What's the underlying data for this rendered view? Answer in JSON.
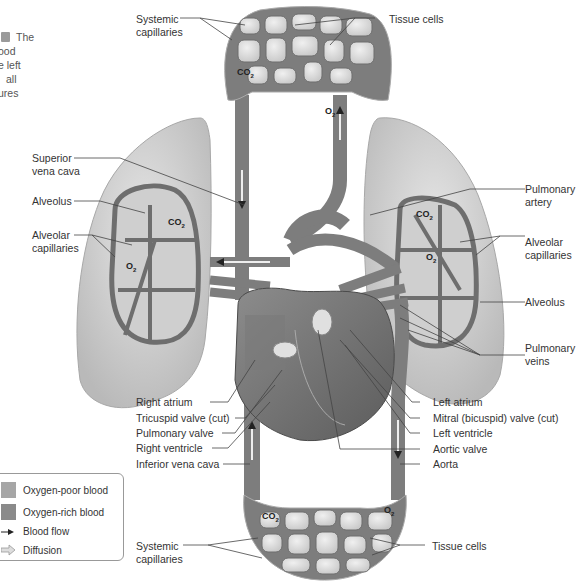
{
  "caption": {
    "badge": "figure-badge",
    "lines": [
      "The",
      "ood",
      "e left",
      "all",
      "ures"
    ]
  },
  "labels": {
    "systemic_capillaries_top": [
      "Systemic",
      "capillaries"
    ],
    "tissue_cells_top": "Tissue cells",
    "superior_vena_cava": [
      "Superior",
      "vena cava"
    ],
    "alveolus_left": "Alveolus",
    "alveolar_capillaries_left": [
      "Alveolar",
      "capillaries"
    ],
    "pulmonary_artery": [
      "Pulmonary",
      "artery"
    ],
    "alveolar_capillaries_right": [
      "Alveolar",
      "capillaries"
    ],
    "alveolus_right": "Alveolus",
    "pulmonary_veins": [
      "Pulmonary",
      "veins"
    ],
    "right_atrium": "Right atrium",
    "tricuspid_valve": "Tricuspid valve (cut)",
    "pulmonary_valve": "Pulmonary valve",
    "right_ventricle": "Right ventricle",
    "inferior_vena_cava": "Inferior vena cava",
    "left_atrium": "Left atrium",
    "mitral_valve": "Mitral (bicuspid) valve (cut)",
    "left_ventricle": "Left ventricle",
    "aortic_valve": "Aortic valve",
    "aorta": "Aorta",
    "systemic_capillaries_bottom": [
      "Systemic",
      "capillaries"
    ],
    "tissue_cells_bottom": "Tissue cells"
  },
  "gases": {
    "co2": "CO",
    "co2_sub": "2",
    "o2": "O",
    "o2_sub": "2"
  },
  "legend": {
    "items": [
      {
        "label": "Oxygen-poor blood",
        "color": "#a6a6a6",
        "icon": "swatch"
      },
      {
        "label": "Oxygen-rich blood",
        "color": "#8a8a8a",
        "icon": "swatch"
      },
      {
        "label": "Blood flow",
        "icon": "arrow-icon"
      },
      {
        "label": "Diffusion",
        "icon": "hollow-arrow-icon"
      }
    ]
  },
  "colors": {
    "vessel": "#7d7d7d",
    "vessel_dark": "#5e5e5e",
    "lung": "#d3d3d3",
    "tissue": "#dcdcdc",
    "heart_muscle": "#6f6f6f",
    "label_line": "#444444"
  }
}
